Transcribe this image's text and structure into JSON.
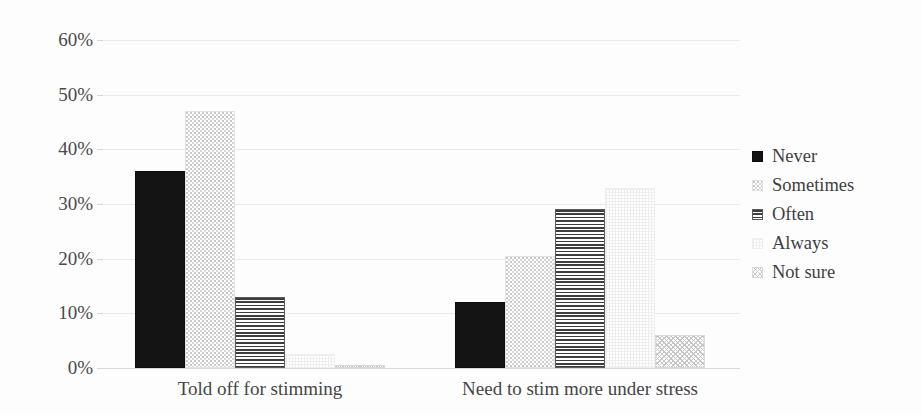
{
  "chart_data": {
    "type": "bar",
    "title": "",
    "subtitle": "",
    "xlabel": "",
    "ylabel": "",
    "categories": [
      "Told off for stimming",
      "Need to stim more under stress"
    ],
    "series": [
      {
        "name": "Never",
        "values": [
          36,
          12
        ]
      },
      {
        "name": "Sometimes",
        "values": [
          47,
          20.5
        ]
      },
      {
        "name": "Often",
        "values": [
          13,
          29
        ]
      },
      {
        "name": "Always",
        "values": [
          2.5,
          33
        ]
      },
      {
        "name": "Not sure",
        "values": [
          0.5,
          6
        ]
      }
    ],
    "ylim": [
      0,
      60
    ],
    "ytick_values": [
      0,
      10,
      20,
      30,
      40,
      50,
      60
    ],
    "ytick_labels": [
      "0%",
      "10%",
      "20%",
      "30%",
      "40%",
      "50%",
      "60%"
    ],
    "grid": true,
    "legend_position": "right",
    "value_format": "percent",
    "series_patterns": [
      "solid-black",
      "light-dotted",
      "horizontal-lines",
      "faint-crosshatch",
      "diagonal-crosshatch"
    ]
  },
  "legend": {
    "items": [
      {
        "label": "Never",
        "pattern": "solid-black"
      },
      {
        "label": "Sometimes",
        "pattern": "light-dotted"
      },
      {
        "label": "Often",
        "pattern": "horizontal-lines"
      },
      {
        "label": "Always",
        "pattern": "faint-crosshatch"
      },
      {
        "label": "Not sure",
        "pattern": "diagonal-crosshatch"
      }
    ]
  },
  "colors": {
    "background": "#fdfdfd",
    "never": "#141414",
    "often": "#3d3d3d",
    "gridline": "#e9e9e9",
    "text": "#3f3f3f"
  }
}
